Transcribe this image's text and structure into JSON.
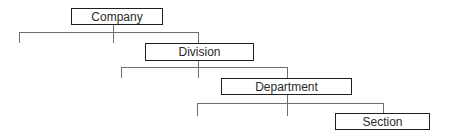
{
  "diagram": {
    "type": "org-hierarchy",
    "nodes": [
      {
        "id": "company",
        "label": "Company"
      },
      {
        "id": "division",
        "label": "Division"
      },
      {
        "id": "department",
        "label": "Department"
      },
      {
        "id": "section",
        "label": "Section"
      }
    ],
    "edges": [
      {
        "from": "company",
        "to": "division"
      },
      {
        "from": "division",
        "to": "department"
      },
      {
        "from": "department",
        "to": "section"
      }
    ],
    "colors": {
      "box_border": "#1e1e1e",
      "connector": "#6e6e6e",
      "text": "#2a2a2a"
    }
  }
}
